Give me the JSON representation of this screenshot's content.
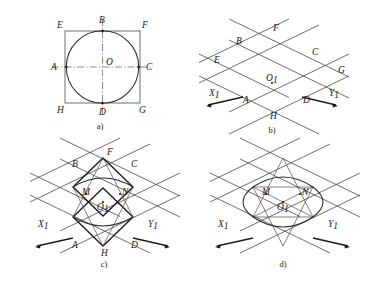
{
  "figure": {
    "background_color": "#ffffff",
    "line_color": "#2b2b2b",
    "panels": [
      {
        "id": "a",
        "caption": "a)",
        "caption_pos": [
          100,
          129
        ],
        "description": "Circle inscribed in a square with centre lines",
        "square": {
          "left": 65,
          "top": 31,
          "right": 140,
          "bottom": 103
        },
        "circle": {
          "cx": 102.5,
          "cy": 67,
          "r": 36.2
        },
        "center_point": {
          "x": 102.5,
          "y": 67
        },
        "labels": [
          {
            "text": "E",
            "x": 57,
            "y": 28
          },
          {
            "text": "B",
            "x": 99,
            "y": 23
          },
          {
            "text": "F",
            "x": 142,
            "y": 28
          },
          {
            "text": "A",
            "x": 51,
            "y": 70
          },
          {
            "text": "O",
            "x": 106,
            "y": 65
          },
          {
            "text": "C",
            "x": 146,
            "y": 70
          },
          {
            "text": "H",
            "x": 57,
            "y": 113
          },
          {
            "text": "D",
            "x": 99,
            "y": 115
          },
          {
            "text": "G",
            "x": 139,
            "y": 113
          }
        ]
      },
      {
        "id": "b",
        "caption": "b)",
        "caption_pos": [
          272,
          133
        ],
        "description": "Isometric rhombus grid with axes X1 and Y1",
        "center": {
          "x": 272,
          "y": 83
        },
        "half_diag_x": 30,
        "half_diag_y": 14.5,
        "labels": [
          {
            "text": "F",
            "x": 273,
            "y": 31
          },
          {
            "text": "B",
            "x": 236,
            "y": 44
          },
          {
            "text": "C",
            "x": 312,
            "y": 55
          },
          {
            "text": "E",
            "x": 214,
            "y": 63
          },
          {
            "text": "G",
            "x": 338,
            "y": 73
          },
          {
            "text": "O",
            "sub": "1",
            "x": 266,
            "y": 81
          },
          {
            "text": "A",
            "x": 243,
            "y": 103
          },
          {
            "text": "D",
            "x": 303,
            "y": 103
          },
          {
            "text": "H",
            "x": 270,
            "y": 119
          }
        ],
        "axes": [
          {
            "name": "X",
            "sub": "1",
            "label_x": 209,
            "label_y": 96,
            "from": [
              243,
              97
            ],
            "to": [
              206,
              106
            ]
          },
          {
            "name": "Y",
            "sub": "1",
            "label_x": 329,
            "label_y": 96,
            "from": [
              302,
              97
            ],
            "to": [
              338,
              106
            ]
          }
        ]
      },
      {
        "id": "c",
        "caption": "c)",
        "caption_pos": [
          104,
          267
        ],
        "description": "Rhombus with construction lines from F and H and two arcs drawn",
        "center": {
          "x": 103,
          "y": 202
        },
        "half_diag_x": 30,
        "half_diag_y": 14.5,
        "labels": [
          {
            "text": "F",
            "x": 107,
            "y": 155
          },
          {
            "text": "B",
            "x": 72,
            "y": 167
          },
          {
            "text": "C",
            "x": 131,
            "y": 167
          },
          {
            "text": "M",
            "x": 82,
            "y": 195
          },
          {
            "text": "N",
            "x": 122,
            "y": 195
          },
          {
            "text": "O",
            "sub": "1",
            "x": 97,
            "y": 210
          },
          {
            "text": "A",
            "x": 72,
            "y": 248
          },
          {
            "text": "D",
            "x": 131,
            "y": 248
          },
          {
            "text": "H",
            "x": 101,
            "y": 256
          }
        ],
        "axes": [
          {
            "name": "X",
            "sub": "1",
            "label_x": 38,
            "label_y": 227,
            "from": [
              73,
              238
            ],
            "to": [
              35,
              247
            ]
          },
          {
            "name": "Y",
            "sub": "1",
            "label_x": 148,
            "label_y": 227,
            "from": [
              133,
              238
            ],
            "to": [
              170,
              247
            ]
          }
        ]
      },
      {
        "id": "d",
        "caption": "d)",
        "caption_pos": [
          283,
          267
        ],
        "description": "Completed four-arc isometric ellipse",
        "center": {
          "x": 283,
          "y": 202
        },
        "half_diag_x": 30,
        "half_diag_y": 14.5,
        "labels": [
          {
            "text": "M",
            "x": 262,
            "y": 195
          },
          {
            "text": "N",
            "x": 302,
            "y": 195
          },
          {
            "text": "O",
            "sub": "1",
            "x": 277,
            "y": 210
          }
        ],
        "axes": [
          {
            "name": "X",
            "sub": "1",
            "label_x": 218,
            "label_y": 227,
            "from": [
              253,
              238
            ],
            "to": [
              215,
              247
            ]
          },
          {
            "name": "Y",
            "sub": "1",
            "label_x": 328,
            "label_y": 227,
            "from": [
              313,
              238
            ],
            "to": [
              350,
              247
            ]
          }
        ]
      }
    ]
  }
}
